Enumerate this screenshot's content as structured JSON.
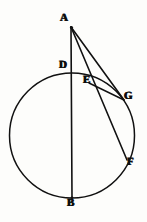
{
  "figure": {
    "type": "geometry-diagram",
    "canvas": {
      "width": 147,
      "height": 222
    },
    "ink_color": "#111111",
    "paper_color": "#fdfdfb",
    "circle": {
      "center_x": 72,
      "center_y": 135.5,
      "radius": 62.5,
      "stroke_width": 1.5
    },
    "points": [
      {
        "id": "A",
        "label": "A",
        "x": 71,
        "y": 27,
        "label_x": 60,
        "label_y": 14
      },
      {
        "id": "D",
        "label": "D",
        "x": 72,
        "y": 73,
        "label_x": 59,
        "label_y": 61
      },
      {
        "id": "E",
        "label": "E",
        "x": 89,
        "y": 83,
        "label_x": 83,
        "label_y": 76
      },
      {
        "id": "G",
        "label": "G",
        "x": 124,
        "y": 100,
        "label_x": 124,
        "label_y": 92
      },
      {
        "id": "F",
        "label": "F",
        "x": 127,
        "y": 160,
        "label_x": 127,
        "label_y": 158
      },
      {
        "id": "B",
        "label": "B",
        "x": 72,
        "y": 198,
        "label_x": 67,
        "label_y": 199
      }
    ],
    "segments": [
      {
        "id": "AB",
        "from": "A",
        "to": "B",
        "stroke_width": 1.6,
        "description": "vertical diameter line from external point A through D to B"
      },
      {
        "id": "AF",
        "from": "A",
        "to": "F",
        "stroke_width": 1.6,
        "description": "secant from A through E to F"
      },
      {
        "id": "AG",
        "from": "A",
        "to": "G",
        "stroke_width": 1.6,
        "description": "secant from A to G"
      },
      {
        "id": "EG",
        "from": "E",
        "to": "G",
        "stroke_width": 1.4,
        "description": "chord from E to G"
      }
    ]
  }
}
